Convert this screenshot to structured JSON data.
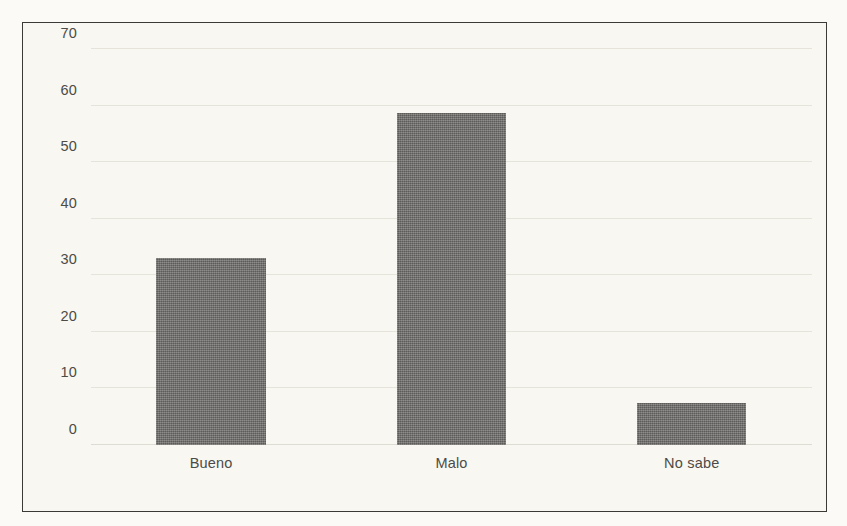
{
  "chart_data": {
    "type": "bar",
    "title": "",
    "subtitle": "",
    "xlabel": "",
    "ylabel": "",
    "categories": [
      "Bueno",
      "Malo",
      "No sabe"
    ],
    "values": [
      33,
      58.7,
      7.5
    ],
    "series": [
      {
        "name": "",
        "values": [
          33,
          58.7,
          7.5
        ]
      }
    ],
    "ylim": [
      0,
      70
    ],
    "yticks": [
      0,
      10,
      20,
      30,
      40,
      50,
      60,
      70
    ],
    "ytick_labels": [
      "0",
      "10",
      "20",
      "30",
      "40",
      "50",
      "60",
      "70"
    ],
    "grid": true,
    "grid_axis": "y",
    "legend": false,
    "legend_position": "none",
    "annotations": [],
    "bar_color": "#6f6e6b",
    "plot_background": "#f8f7f2",
    "gridline_color": "#e6e3da",
    "frame_color": "#3b3a36",
    "tick_label_color": "#4d4b46"
  }
}
